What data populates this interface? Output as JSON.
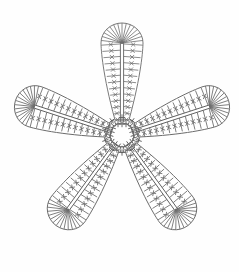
{
  "document": {
    "title": "Crochet Flower Motif Chart",
    "kind": "crochet-pattern-diagram",
    "background_color": "#fefefe",
    "ink_color": "#6a6a6a",
    "width": 239,
    "height": 272
  },
  "chart_data": {
    "type": "diagram",
    "subtitle": "",
    "xlabel": "",
    "ylabel": "",
    "grid": false,
    "legend": "none",
    "center": {
      "x": 122,
      "y": 135,
      "ring_radius": 12,
      "label": "magic ring"
    },
    "petal_count": 5,
    "petal_geometry": {
      "length": 112,
      "tip_half_width": 21,
      "base_half_width": 7,
      "fan_line_count": 15,
      "rung_count": 13,
      "spine_count": 2
    },
    "categories": [
      "petal-top",
      "petal-upper-right",
      "petal-lower-right",
      "petal-lower-left",
      "petal-upper-left"
    ],
    "values": [
      1,
      1,
      1,
      1,
      1
    ],
    "series": [
      {
        "name": "petal angle (degrees, 0 = up, clockwise)",
        "values": [
          0,
          72,
          144,
          216,
          288
        ]
      },
      {
        "name": "tip center x",
        "values": [
          122,
          203,
          172,
          72,
          42
        ]
      },
      {
        "name": "tip center y",
        "values": [
          36,
          82,
          190,
          190,
          82
        ]
      }
    ],
    "annotations": [
      {
        "symbol": "+",
        "name": "single crochet",
        "count": 10,
        "location": "around center ring"
      },
      {
        "symbol": "oval",
        "name": "chain stitch",
        "count": 5,
        "location": "between petal bases"
      },
      {
        "symbol": "rung",
        "name": "double crochet row",
        "count_per_petal": 13
      },
      {
        "symbol": "fan",
        "name": "increase fan at petal tip",
        "count_per_petal": 15
      }
    ]
  },
  "center_ring": {
    "radius": 12,
    "chain_oval_count": 5,
    "sc_mark_count": 10
  },
  "petals": [
    {
      "id": "petal-top",
      "label": "Top petal",
      "angle": 0
    },
    {
      "id": "petal-upper-right",
      "label": "Upper right petal",
      "angle": 72
    },
    {
      "id": "petal-lower-right",
      "label": "Lower right petal",
      "angle": 144
    },
    {
      "id": "petal-lower-left",
      "label": "Lower left petal",
      "angle": 216
    },
    {
      "id": "petal-upper-left",
      "label": "Upper left petal",
      "angle": 288
    }
  ]
}
